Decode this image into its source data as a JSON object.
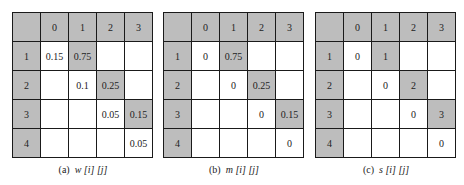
{
  "tables": [
    {
      "caption_label": "(a)",
      "caption_var": "w [i] [j]",
      "header": [
        "",
        "0",
        "1",
        "2",
        "3"
      ],
      "rows": [
        [
          "1",
          "0.15",
          "0.75",
          "",
          ""
        ],
        [
          "2",
          "",
          "0.1",
          "0.25",
          ""
        ],
        [
          "3",
          "",
          "",
          "0.05",
          "0.15"
        ],
        [
          "4",
          "",
          "",
          "",
          "0.05"
        ]
      ]
    },
    {
      "caption_label": "(b)",
      "caption_var": "m [i] [j]",
      "header": [
        "",
        "0",
        "1",
        "2",
        "3"
      ],
      "rows": [
        [
          "1",
          "0",
          "0.75",
          "",
          ""
        ],
        [
          "2",
          "",
          "0",
          "0.25",
          ""
        ],
        [
          "3",
          "",
          "",
          "0",
          "0.15"
        ],
        [
          "4",
          "",
          "",
          "",
          "0"
        ]
      ]
    },
    {
      "caption_label": "(c)",
      "caption_var": "s [i] [j]",
      "header": [
        "",
        "0",
        "1",
        "2",
        "3"
      ],
      "rows": [
        [
          "1",
          "0",
          "1",
          "",
          ""
        ],
        [
          "2",
          "",
          "0",
          "2",
          ""
        ],
        [
          "3",
          "",
          "",
          "0",
          "3"
        ],
        [
          "4",
          "",
          "",
          "",
          "0"
        ]
      ]
    }
  ],
  "colors": {
    "shade": "#bdbdbd",
    "border": "#1a1a1a"
  }
}
